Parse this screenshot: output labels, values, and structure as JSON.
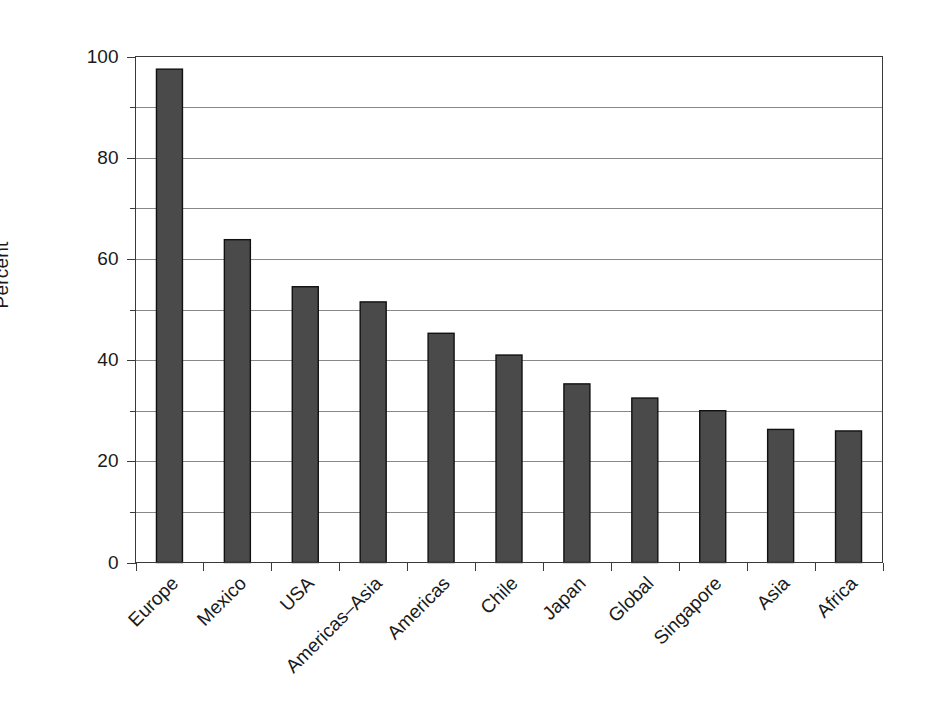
{
  "chart_data": {
    "type": "bar",
    "title": "",
    "xlabel": "",
    "ylabel": "Percent",
    "categories": [
      "Europe",
      "Mexico",
      "USA",
      "Americas–Asia",
      "Americas",
      "Chile",
      "Japan",
      "Global",
      "Singapore",
      "Asia",
      "Africa"
    ],
    "values": [
      97.5,
      63.8,
      54.5,
      51.5,
      45.3,
      41.0,
      35.3,
      32.5,
      30.0,
      26.3,
      26.0
    ],
    "ylim": [
      0,
      100
    ],
    "y_major_ticks": [
      0,
      20,
      40,
      60,
      80,
      100
    ],
    "y_minor_ticks": [
      10,
      30,
      50,
      70,
      90
    ],
    "y_tick_labels": [
      "0",
      "20",
      "40",
      "60",
      "80",
      "100"
    ],
    "grid": "horizontal",
    "legend": "none",
    "bar_color": "#4a4a4a",
    "bar_edge_color": "#111111",
    "grid_color": "#888888",
    "axis_color": "#3a3a3a",
    "x_label_rotation_deg": 45
  }
}
